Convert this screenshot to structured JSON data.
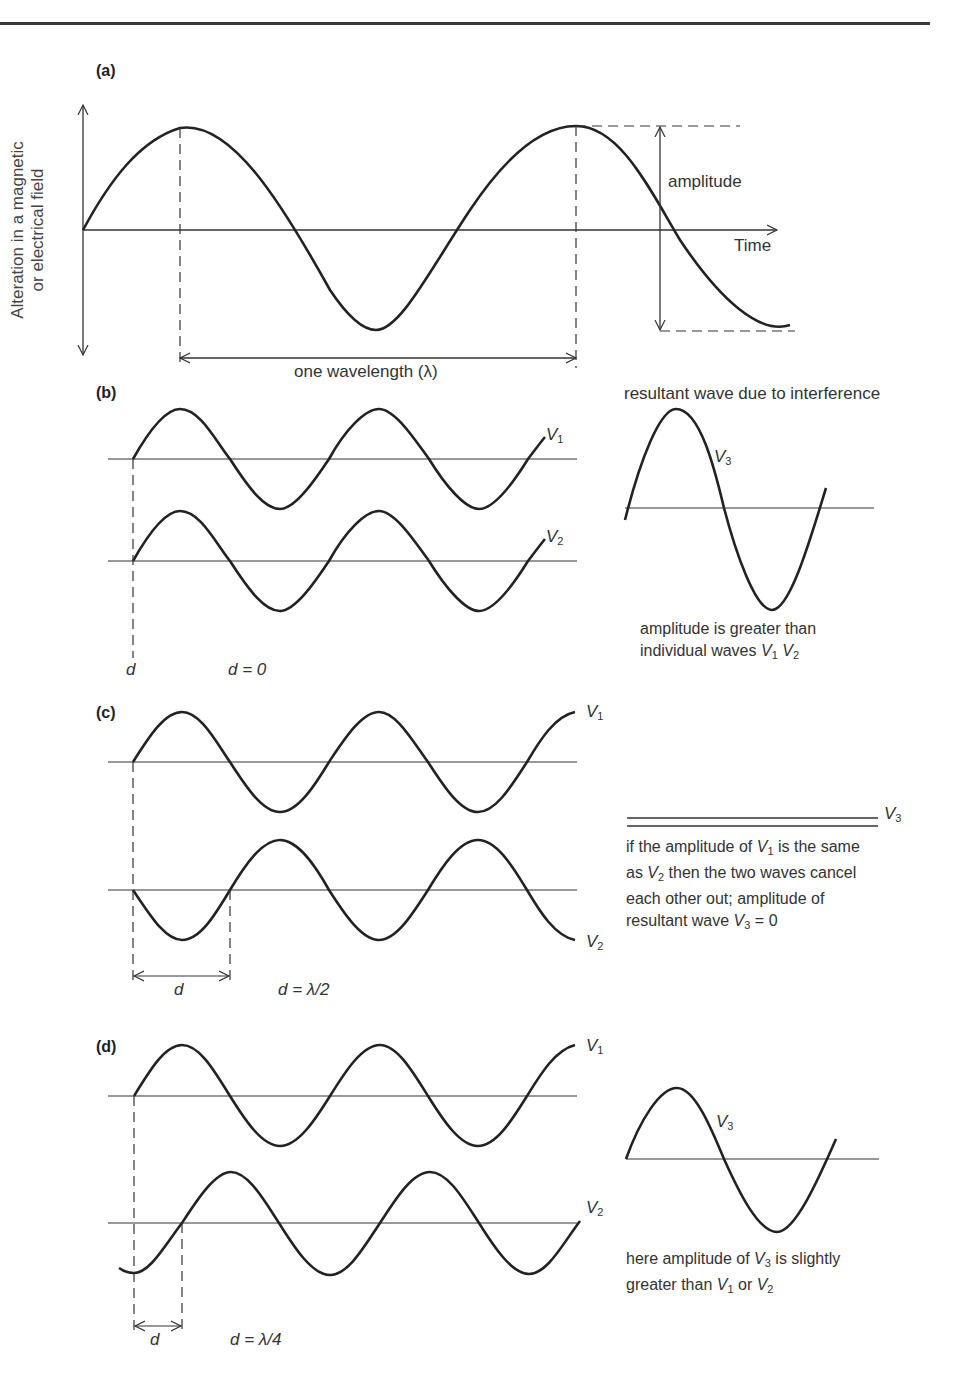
{
  "figure": {
    "panels": {
      "a": {
        "label": "(a)",
        "y_axis_label_line1": "Alteration in a magnetic",
        "y_axis_label_line2": "or electrical field",
        "x_axis_label": "Time",
        "amplitude_label": "amplitude",
        "wavelength_label": "one wavelength (λ)"
      },
      "b": {
        "label": "(b)",
        "wave1": "V",
        "wave1_sub": "1",
        "wave2": "V",
        "wave2_sub": "2",
        "d_label": "d",
        "d_equation": "d = 0",
        "resultant_title": "resultant wave due to interference",
        "resultant": "V",
        "resultant_sub": "3",
        "note_line1": "amplitude is greater than",
        "note_line2_prefix": "individual waves ",
        "note_v1": "V",
        "note_v1_sub": "1",
        "note_v2": "V",
        "note_v2_sub": "2"
      },
      "c": {
        "label": "(c)",
        "wave1": "V",
        "wave1_sub": "1",
        "wave2": "V",
        "wave2_sub": "2",
        "d_label": "d",
        "d_equation": "d = λ/2",
        "resultant": "V",
        "resultant_sub": "3",
        "note_line1_a": "if the amplitude of ",
        "note_line1_v": "V",
        "note_line1_sub": "1",
        "note_line1_b": " is the same",
        "note_line2_a": "as ",
        "note_line2_v": "V",
        "note_line2_sub": "2",
        "note_line2_b": " then the two waves cancel",
        "note_line3": "each other out; amplitude of",
        "note_line4_a": "resultant wave  ",
        "note_line4_v": "V",
        "note_line4_sub": "3",
        "note_line4_b": " = 0"
      },
      "d": {
        "label": "(d)",
        "wave1": "V",
        "wave1_sub": "1",
        "wave2": "V",
        "wave2_sub": "2",
        "d_label": "d",
        "d_equation": "d = λ/4",
        "resultant": "V",
        "resultant_sub": "3",
        "note_line1_a": "here amplitude of ",
        "note_line1_v": "V",
        "note_line1_sub": "3",
        "note_line1_b": " is slightly",
        "note_line2_a": "greater than ",
        "note_line2_v1": "V",
        "note_line2_sub1": "1",
        "note_line2_or": " or ",
        "note_line2_v2": "V",
        "note_line2_sub2": "2"
      }
    }
  }
}
